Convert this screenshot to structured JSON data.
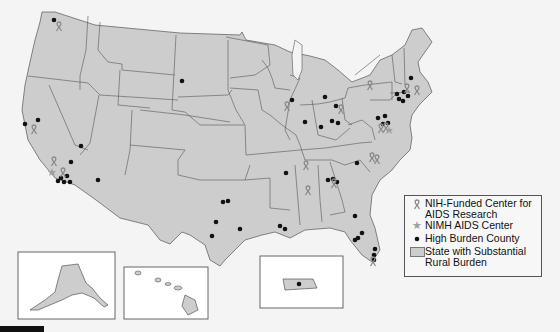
{
  "map": {
    "title": "",
    "colors": {
      "state_fill": "#cdcdcd",
      "state_stroke": "#555555",
      "background": "#f4f4f4",
      "dot": "#111111",
      "ribbon": "#8a8a8a",
      "star": "#a0a0a0"
    },
    "insets": [
      {
        "name": "Alaska"
      },
      {
        "name": "Hawaii"
      },
      {
        "name": "Puerto Rico"
      }
    ]
  },
  "legend": {
    "items": [
      {
        "icon": "ribbon-icon",
        "label": "NIH-Funded Center for\nAIDS Research"
      },
      {
        "icon": "star-icon",
        "label": "NIMH AIDS Center"
      },
      {
        "icon": "dot-icon",
        "label": "High Burden County"
      },
      {
        "icon": "swatch-icon",
        "label": "State with Substantial\nRural Burden"
      }
    ]
  }
}
